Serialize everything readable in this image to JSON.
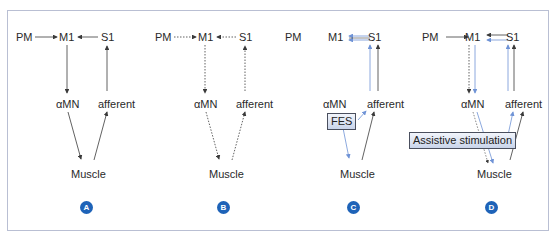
{
  "panels": [
    {
      "id": "A",
      "badge": "A",
      "nodes": {
        "pm": "PM",
        "m1": "M1",
        "s1": "S1",
        "amn": "αMN",
        "afferent": "afferent",
        "muscle": "Muscle"
      },
      "pathway_style": "solid"
    },
    {
      "id": "B",
      "badge": "B",
      "nodes": {
        "pm": "PM",
        "m1": "M1",
        "s1": "S1",
        "amn": "αMN",
        "afferent": "afferent",
        "muscle": "Muscle"
      },
      "pathway_style": "dotted"
    },
    {
      "id": "C",
      "badge": "C",
      "nodes": {
        "pm": "PM",
        "m1": "M1",
        "s1": "S1",
        "amn": "αMN",
        "afferent": "afferent",
        "muscle": "Muscle"
      },
      "stimulation_label": "FES"
    },
    {
      "id": "D",
      "badge": "D",
      "nodes": {
        "pm": "PM",
        "m1": "M1",
        "s1": "S1",
        "amn": "αMN",
        "afferent": "afferent",
        "muscle": "Muscle"
      },
      "stimulation_label": "Assistive stimulation"
    }
  ],
  "colors": {
    "frame_border": "#b9bfd3",
    "badge_fill": "#1e63b8",
    "arrow_dark": "#3a3a3a",
    "arrow_blue": "#6f93d6",
    "stim_box_top": "#f2f5fb",
    "stim_box_bottom": "#c9d4ea"
  }
}
